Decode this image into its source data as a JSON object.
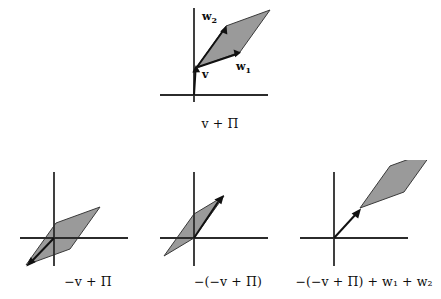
{
  "figure": {
    "colors": {
      "plane_fill": "#9a9a9a",
      "plane_stroke": "#3a3a3a",
      "axis": "#2b2b2b",
      "vector": "#111111",
      "background": "#ffffff"
    }
  },
  "panels": [
    {
      "id": "top",
      "caption": "v + Π",
      "caption_parts": {
        "prefix": "",
        "vector": "v",
        "operator": " + ",
        "plane": "Π"
      },
      "labels": [
        {
          "name": "w2",
          "text": "w",
          "sub": "2"
        },
        {
          "name": "w1",
          "text": "w",
          "sub": "1"
        },
        {
          "name": "v",
          "text": "v",
          "sub": ""
        }
      ],
      "vectors": [
        "v",
        "w1",
        "w2"
      ],
      "plane_shown": true
    },
    {
      "id": "bottom-left",
      "caption": "−v + Π",
      "caption_parts": {
        "prefix": "−",
        "vector": "v",
        "operator": " + ",
        "plane": "Π"
      },
      "labels": [],
      "vectors": [
        "-v"
      ],
      "plane_shown": true
    },
    {
      "id": "bottom-middle",
      "caption": "−(−v + Π)",
      "caption_parts": {
        "prefix": "−(−",
        "vector": "v",
        "operator": " + ",
        "plane": "Π)"
      },
      "labels": [],
      "vectors": [
        "v"
      ],
      "plane_shown": true
    },
    {
      "id": "bottom-right",
      "caption": "−(−v + Π) + w₁ + w₂",
      "caption_parts": {
        "prefix": "−(−",
        "vector": "v",
        "operator": " + ",
        "plane": "Π)"
      },
      "labels": [],
      "vectors": [
        "v"
      ],
      "plane_shown": true
    }
  ],
  "captions": {
    "top": "v + Π",
    "bottom_left": "−v + Π",
    "bottom_middle": "−(−v + Π)",
    "bottom_right": "−(−v + Π) + w₁ + w₂"
  },
  "label_text": {
    "w2_base": "w",
    "w2_sub": "2",
    "w1_base": "w",
    "w1_sub": "1",
    "v": "v"
  }
}
